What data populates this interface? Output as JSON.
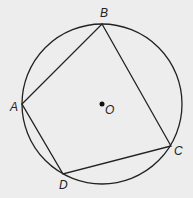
{
  "diagram": {
    "type": "inscribed-quadrilateral",
    "circle": {
      "cx": 102,
      "cy": 104,
      "r": 80,
      "stroke": "#222222"
    },
    "center": {
      "label": "O",
      "x": 102,
      "y": 104
    },
    "vertices": [
      {
        "label": "A",
        "x": 22,
        "y": 104
      },
      {
        "label": "B",
        "x": 102,
        "y": 24
      },
      {
        "label": "C",
        "x": 171,
        "y": 146
      },
      {
        "label": "D",
        "x": 63,
        "y": 174
      }
    ],
    "polygon_order": [
      "A",
      "B",
      "C",
      "D"
    ]
  }
}
